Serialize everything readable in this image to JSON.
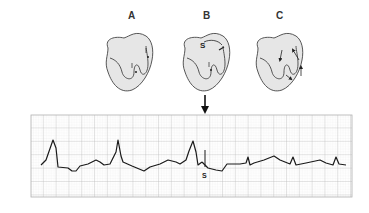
{
  "panels": [
    {
      "label": "A",
      "x": 128,
      "y": 17
    },
    {
      "label": "B",
      "x": 203,
      "y": 17
    },
    {
      "label": "C",
      "x": 276,
      "y": 17
    }
  ],
  "stimulus_label_heart": "S",
  "stimulus_label_ecg": "S",
  "colors": {
    "heart_fill": "#e6e6e6",
    "outline": "#444444",
    "grid_major": "#b5b5b5",
    "grid_minor": "#dedede",
    "trace": "#1a1a1a"
  },
  "ecg": {
    "grid": {
      "x": 31,
      "y": 115,
      "width": 321,
      "height": 82,
      "major": 12.8,
      "minor": 2.56
    },
    "trace_before": "M41,165 L46,160 L53,140 L56,148 L58,167 L68,168 L72,171 L76,171 L80,166 L88,164 L96,160 L100,162 L104,165 L110,164 L116,152 L118,140 L121,156 L123,162 L132,166 L144,171 L150,167 L160,164 L168,160 L176,162 L180,164 L186,160 L189,151 L193,141 L196,152 L198,165 L202,162",
    "trace_after": "M202,162 L208,168 L216,170 L222,171 L227,164 L240,164 L246,163 L248,157 L250,165 L254,163 L264,160 L274,156 L280,160 L290,164 L293,157 L296,165 L306,163 L320,160 L326,163 L333,165 L336,157 L339,164 L346,165",
    "stimulus_x": 205,
    "stimulus_y1": 150,
    "stimulus_y2": 167
  }
}
